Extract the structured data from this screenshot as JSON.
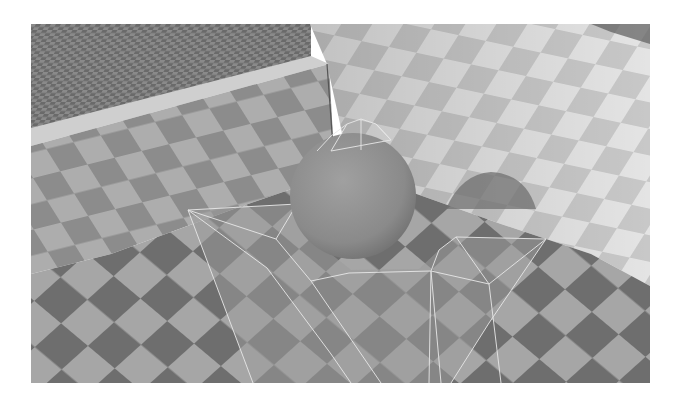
{
  "image": {
    "description": "Grayscale 3D render: checkerboard-tiled room corner with a sphere and a translucent wireframe polygon mesh on the floor",
    "frame": {
      "x": 31,
      "y": 24,
      "width": 619,
      "height": 359
    },
    "colors": {
      "background": "#ffffff",
      "far_floor_dark": "#6a6a6a",
      "far_floor_light": "#8a8a8a",
      "left_wall_dark": "#8c8c8c",
      "left_wall_light": "#adadad",
      "right_wall_dark": "#c8c8c8",
      "right_wall_light": "#e4e4e4",
      "floor_dark": "#6e6e6e",
      "floor_light": "#a6a6a6",
      "sphere": "#8f8f8f",
      "shadow": "#707070",
      "wire": "#e8e8e8",
      "mesh_fill": "#9a9a9a"
    },
    "objects": [
      "far-floor",
      "left-wall",
      "right-wall",
      "wall-ledge",
      "floor",
      "sphere",
      "sphere-shadow",
      "wireframe-mesh"
    ]
  }
}
